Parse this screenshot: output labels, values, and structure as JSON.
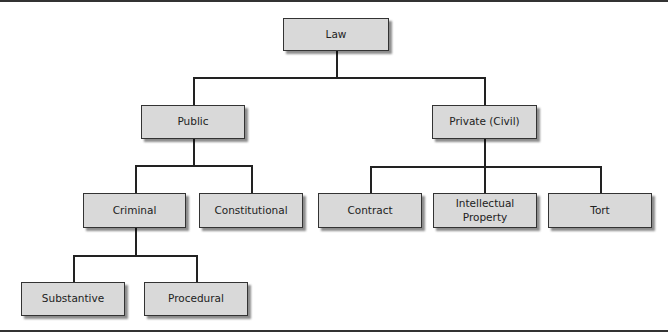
{
  "diagram": {
    "type": "hierarchy-tree",
    "nodes": {
      "law": "Law",
      "public": "Public",
      "private": "Private (Civil)",
      "criminal": "Criminal",
      "constitutional": "Constitutional",
      "contract": "Contract",
      "intellectual_property": "Intellectual Property",
      "tort": "Tort",
      "substantive": "Substantive",
      "procedural": "Procedural"
    },
    "edges": [
      [
        "Law",
        "Public"
      ],
      [
        "Law",
        "Private (Civil)"
      ],
      [
        "Public",
        "Criminal"
      ],
      [
        "Public",
        "Constitutional"
      ],
      [
        "Private (Civil)",
        "Contract"
      ],
      [
        "Private (Civil)",
        "Intellectual Property"
      ],
      [
        "Private (Civil)",
        "Tort"
      ],
      [
        "Criminal",
        "Substantive"
      ],
      [
        "Criminal",
        "Procedural"
      ]
    ],
    "colors": {
      "node_fill": "#d9d9d9",
      "node_border": "#333333",
      "line": "#222222"
    }
  }
}
